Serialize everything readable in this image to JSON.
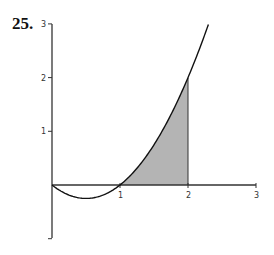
{
  "problem_number": "25.",
  "chart_data": {
    "type": "line",
    "title": "",
    "xlabel": "",
    "ylabel": "",
    "function": "y = x^2 - x",
    "x_ticks": [
      "1",
      "2",
      "3"
    ],
    "y_ticks": [
      "1",
      "2",
      "3"
    ],
    "xlim": [
      0,
      3
    ],
    "ylim": [
      -1,
      3
    ],
    "grid": false,
    "legend": null,
    "curve_domain": [
      0,
      2.3
    ],
    "shaded_region": {
      "from_x": 1,
      "to_x": 2,
      "description": "area under curve between x=1 and x=2",
      "color": "#b4b4b4"
    },
    "series": [
      {
        "name": "f(x)",
        "x": [
          0,
          0.25,
          0.5,
          0.75,
          1,
          1.25,
          1.5,
          1.75,
          2,
          2.3
        ],
        "values": [
          0,
          -0.1875,
          -0.25,
          -0.1875,
          0,
          0.3125,
          0.75,
          1.3125,
          2,
          2.99
        ]
      }
    ]
  },
  "colors": {
    "axis": "#333333",
    "curve": "#111111",
    "shade": "#b4b4b4"
  }
}
